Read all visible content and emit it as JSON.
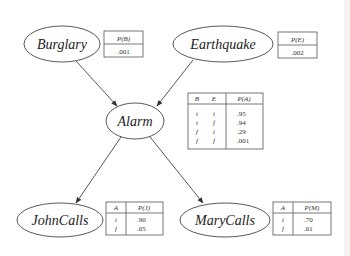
{
  "diagram": {
    "type": "bayesian-network",
    "nodes": [
      {
        "id": "burglary",
        "label": "Burglary",
        "cx": 62,
        "cy": 44,
        "rx": 38,
        "ry": 18
      },
      {
        "id": "earthquake",
        "label": "Earthquake",
        "cx": 223,
        "cy": 44,
        "rx": 50,
        "ry": 18
      },
      {
        "id": "alarm",
        "label": "Alarm",
        "cx": 135,
        "cy": 121,
        "rx": 29,
        "ry": 18
      },
      {
        "id": "johncalls",
        "label": "JohnCalls",
        "cx": 60,
        "cy": 220,
        "rx": 43,
        "ry": 17
      },
      {
        "id": "marycalls",
        "label": "MaryCalls",
        "cx": 225,
        "cy": 220,
        "rx": 45,
        "ry": 17
      }
    ],
    "edges": [
      {
        "from": "burglary",
        "to": "alarm"
      },
      {
        "from": "earthquake",
        "to": "alarm"
      },
      {
        "from": "alarm",
        "to": "johncalls"
      },
      {
        "from": "alarm",
        "to": "marycalls"
      }
    ],
    "cpts": {
      "burglary": {
        "header": "P(B)",
        "value": ".001"
      },
      "earthquake": {
        "header": "P(E)",
        "value": ".002"
      },
      "alarm": {
        "headers": [
          "B",
          "E",
          "P(A)"
        ],
        "rows": [
          [
            "t",
            "t",
            ".95"
          ],
          [
            "t",
            "f",
            ".94"
          ],
          [
            "f",
            "t",
            ".29"
          ],
          [
            "f",
            "f",
            ".001"
          ]
        ]
      },
      "johncalls": {
        "headers": [
          "A",
          "P(J)"
        ],
        "rows": [
          [
            "t",
            ".90"
          ],
          [
            "f",
            ".05"
          ]
        ]
      },
      "marycalls": {
        "headers": [
          "A",
          "P(M)"
        ],
        "rows": [
          [
            "t",
            ".70"
          ],
          [
            "f",
            ".01"
          ]
        ]
      }
    }
  }
}
